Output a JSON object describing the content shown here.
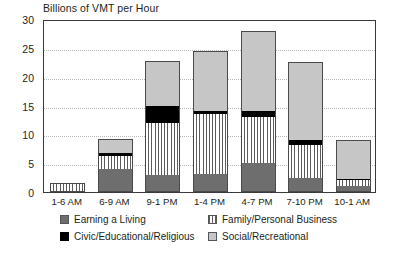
{
  "chart_data": {
    "type": "bar",
    "stacked": true,
    "title": "Billions of VMT per Hour",
    "xlabel": "",
    "ylabel": "",
    "ylim": [
      0,
      30
    ],
    "ytick_step": 5,
    "yticks": [
      "0",
      "5",
      "10",
      "15",
      "20",
      "25",
      "30"
    ],
    "grid": true,
    "legend_position": "bottom",
    "categories": [
      "1-6 AM",
      "6-9 AM",
      "9-1 PM",
      "1-4 PM",
      "4-7 PM",
      "7-10 PM",
      "10-1 AM"
    ],
    "series": [
      {
        "name": "Earning a Living",
        "key": "earning",
        "color": "#6e6e6e",
        "pattern": "solid-dark-gray",
        "values": [
          0.1,
          4.0,
          3.0,
          3.1,
          5.1,
          2.5,
          1.0
        ]
      },
      {
        "name": "Family/Personal Business",
        "key": "family",
        "color": "#ffffff",
        "pattern": "vertical-stripes",
        "values": [
          1.4,
          2.2,
          9.0,
          10.4,
          7.9,
          5.7,
          1.1
        ]
      },
      {
        "name": "Civic/Educational/Religious",
        "key": "civic",
        "color": "#000000",
        "pattern": "solid-black",
        "values": [
          0.0,
          0.5,
          3.0,
          0.6,
          1.0,
          0.8,
          0.2
        ]
      },
      {
        "name": "Social/Recreational",
        "key": "social",
        "color": "#c6c6c6",
        "pattern": "solid-light-gray",
        "values": [
          0.0,
          2.5,
          7.8,
          10.4,
          14.0,
          13.6,
          6.7
        ]
      }
    ],
    "totals": [
      1.5,
      9.2,
      22.8,
      24.5,
      28.0,
      22.6,
      9.0
    ]
  },
  "legend": {
    "items": [
      {
        "label": "Earning a Living",
        "key": "earning"
      },
      {
        "label": "Family/Personal Business",
        "key": "family"
      },
      {
        "label": "Civic/Educational/Religious",
        "key": "civic"
      },
      {
        "label": "Social/Recreational",
        "key": "social"
      }
    ]
  }
}
